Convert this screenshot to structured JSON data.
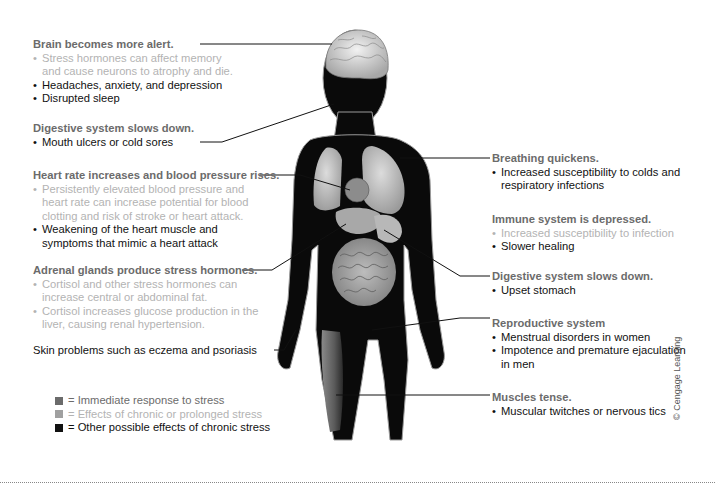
{
  "colors": {
    "immediate": "#6b6b6b",
    "chronic": "#b3b3b3",
    "other": "#111111",
    "silhouette": "#0a0a0a",
    "organs": "#bdbdbd"
  },
  "left_labels": [
    {
      "heading": "Brain becomes more alert.",
      "items": [
        {
          "type": "chronic",
          "lines": [
            "Stress hormones can affect memory",
            "and cause neurons to atrophy and die."
          ]
        },
        {
          "type": "other",
          "lines": [
            "Headaches, anxiety, and depression"
          ]
        },
        {
          "type": "other",
          "lines": [
            "Disrupted sleep"
          ]
        }
      ]
    },
    {
      "heading": "Digestive system slows down.",
      "items": [
        {
          "type": "other",
          "lines": [
            "Mouth ulcers or cold sores"
          ]
        }
      ]
    },
    {
      "heading": "Heart rate increases and blood pressure rises.",
      "items": [
        {
          "type": "chronic",
          "lines": [
            "Persistently elevated blood pressure and",
            "heart rate can increase potential for blood",
            "clotting and risk of stroke or heart attack."
          ]
        },
        {
          "type": "other",
          "lines": [
            "Weakening of the heart muscle and",
            "symptoms that mimic a heart attack"
          ]
        }
      ]
    },
    {
      "heading": "Adrenal glands produce stress hormones.",
      "items": [
        {
          "type": "chronic",
          "lines": [
            "Cortisol and other stress hormones can",
            "increase central or abdominal fat."
          ]
        },
        {
          "type": "chronic",
          "lines": [
            "Cortisol increases glucose production in the",
            "liver, causing renal hypertension."
          ]
        }
      ]
    }
  ],
  "skin_label": "Skin problems such as eczema and psoriasis",
  "right_labels": [
    {
      "heading": "Breathing quickens.",
      "items": [
        {
          "type": "other",
          "lines": [
            "Increased susceptibility to colds and",
            "respiratory infections"
          ]
        }
      ]
    },
    {
      "heading": "Immune system is depressed.",
      "items": [
        {
          "type": "chronic",
          "lines": [
            "Increased susceptibility to infection"
          ]
        },
        {
          "type": "other",
          "lines": [
            "Slower healing"
          ]
        }
      ]
    },
    {
      "heading": "Digestive system slows down.",
      "items": [
        {
          "type": "other",
          "lines": [
            "Upset stomach"
          ]
        }
      ]
    },
    {
      "heading": "Reproductive system",
      "items": [
        {
          "type": "other",
          "lines": [
            "Menstrual disorders in women"
          ]
        },
        {
          "type": "other",
          "lines": [
            "Impotence and premature ejaculation",
            "in men"
          ]
        }
      ]
    },
    {
      "heading": "Muscles tense.",
      "items": [
        {
          "type": "other",
          "lines": [
            "Muscular twitches or nervous tics"
          ]
        }
      ]
    }
  ],
  "legend": [
    {
      "type": "immediate",
      "text": "= Immediate response to stress"
    },
    {
      "type": "chronic",
      "text": "= Effects of chronic or prolonged stress"
    },
    {
      "type": "other",
      "text": "= Other possible effects of chronic stress"
    }
  ],
  "bullet": "•",
  "copyright": "© Cengage Learning"
}
